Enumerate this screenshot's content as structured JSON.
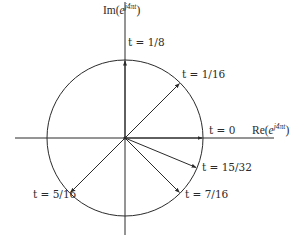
{
  "diagram": {
    "center": {
      "x": 125,
      "y": 138
    },
    "radius": 78,
    "stroke_color": "#2a2a2a",
    "axes": {
      "horizontal": {
        "x1": 15,
        "x2": 274
      },
      "vertical": {
        "y1": 2,
        "y2": 235
      },
      "x_label": {
        "prefix": "Re(",
        "base": "e",
        "exponent": "j4πt",
        "suffix": ")"
      },
      "y_label": {
        "prefix": "Im(",
        "base": "e",
        "exponent": "j4πt",
        "suffix": ")"
      }
    },
    "phasors": [
      {
        "t_label": "t = 0",
        "t": 0,
        "angle_deg": 0
      },
      {
        "t_label": "t = 1/16",
        "t": 0.0625,
        "angle_deg": 45
      },
      {
        "t_label": "t = 1/8",
        "t": 0.125,
        "angle_deg": 90
      },
      {
        "t_label": "t = 5/16",
        "t": 0.3125,
        "angle_deg": 225
      },
      {
        "t_label": "t = 7/16",
        "t": 0.4375,
        "angle_deg": 315
      },
      {
        "t_label": "t = 15/32",
        "t": 0.46875,
        "angle_deg": 337.5
      }
    ]
  }
}
